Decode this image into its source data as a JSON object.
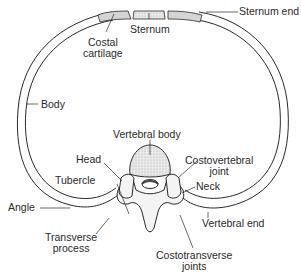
{
  "diagram": {
    "labels": {
      "costal_cartilage": [
        "Costal",
        "cartilage"
      ],
      "sternum": "Sternum",
      "sternum_end": "Sternum end",
      "body": "Body",
      "vertebral_body": "Vertebral body",
      "head": "Head",
      "costovertebral_joint": [
        "Costovertebral",
        "joint"
      ],
      "tubercle": "Tubercle",
      "neck": "Neck",
      "angle": "Angle",
      "vertebral_end": "Vertebral end",
      "transverse_process": [
        "Transverse",
        "process"
      ],
      "costotransverse_joints": [
        "Costotransverse",
        "joints"
      ]
    },
    "colors": {
      "line": "#2a2a2a",
      "cartilage_fill": "#d4d4d4",
      "bone_fill": "#f4f4f4",
      "stipple": "#c8c8c8"
    }
  }
}
